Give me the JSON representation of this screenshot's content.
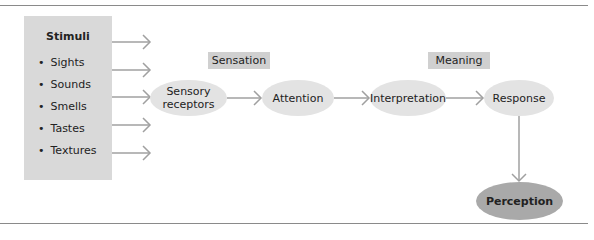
{
  "diagram": {
    "stimuli": {
      "title": "Stimuli",
      "items": [
        "Sights",
        "Sounds",
        "Smells",
        "Tastes",
        "Textures"
      ]
    },
    "stage_labels": {
      "sensation": "Sensation",
      "meaning": "Meaning"
    },
    "nodes": {
      "sensory_receptors_line1": "Sensory",
      "sensory_receptors_line2": "receptors",
      "attention": "Attention",
      "interpretation": "Interpretation",
      "response": "Response",
      "perception": "Perception"
    },
    "colors": {
      "box_fill": "#d9d9d9",
      "node_fill": "#e3e3e3",
      "final_node_fill": "#a9a9a9",
      "arrow": "#a0a0a0",
      "rule": "#8a8a8a"
    }
  }
}
